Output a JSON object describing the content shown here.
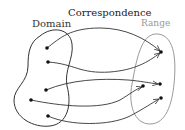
{
  "diagram": {
    "title": "Correspondence",
    "domain_label": "Domain",
    "range_label": "Range",
    "colors": {
      "domain_outline": "#333333",
      "range_outline": "#999999",
      "arrow": "#333333",
      "point": "#111111",
      "title": "#222222"
    },
    "domain_points": [
      {
        "id": "d1",
        "x": 47,
        "y": 48
      },
      {
        "id": "d2",
        "x": 48,
        "y": 62
      },
      {
        "id": "d3",
        "x": 46,
        "y": 90
      },
      {
        "id": "d4",
        "x": 31,
        "y": 100
      },
      {
        "id": "d5",
        "x": 48,
        "y": 116
      }
    ],
    "range_points": [
      {
        "id": "r1",
        "x": 161,
        "y": 52
      },
      {
        "id": "r2",
        "x": 160,
        "y": 84
      },
      {
        "id": "r3",
        "x": 143,
        "y": 86
      },
      {
        "id": "r4",
        "x": 161,
        "y": 98
      }
    ],
    "mappings": [
      {
        "from": "d1",
        "to": "r1"
      },
      {
        "from": "d2",
        "to": "r1"
      },
      {
        "from": "d3",
        "to": "r2"
      },
      {
        "from": "d4",
        "to": "r3"
      },
      {
        "from": "d5",
        "to": "r4"
      }
    ]
  }
}
